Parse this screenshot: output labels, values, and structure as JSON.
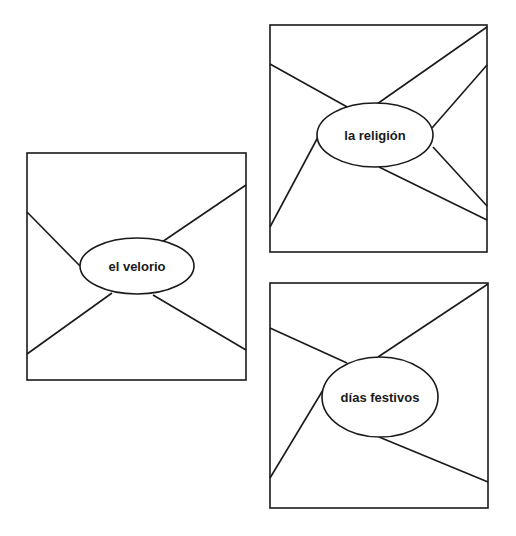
{
  "diagrams": [
    {
      "name": "web-el-velorio",
      "label": "el velorio",
      "box": {
        "x": 27,
        "y": 153,
        "w": 219,
        "h": 227
      },
      "ellipse": {
        "cx": 137,
        "cy": 266,
        "rx": 57,
        "ry": 28
      },
      "spokes": [
        [
          27,
          212,
          80,
          266
        ],
        [
          162,
          242,
          246,
          185
        ],
        [
          112,
          293,
          27,
          354
        ],
        [
          153,
          295,
          246,
          350
        ]
      ]
    },
    {
      "name": "web-la-religion",
      "label": "la religión",
      "box": {
        "x": 270,
        "y": 25,
        "w": 217,
        "h": 227
      },
      "ellipse": {
        "cx": 375,
        "cy": 135,
        "rx": 58,
        "ry": 32
      },
      "spokes": [
        [
          270,
          64,
          349,
          108
        ],
        [
          377,
          104,
          487,
          27
        ],
        [
          432,
          128,
          487,
          65
        ],
        [
          318,
          137,
          270,
          227
        ],
        [
          433,
          147,
          487,
          206
        ],
        [
          379,
          167,
          487,
          220
        ]
      ]
    },
    {
      "name": "web-dias-festivos",
      "label": "días festivos",
      "box": {
        "x": 270,
        "y": 283,
        "w": 218,
        "h": 225
      },
      "ellipse": {
        "cx": 380,
        "cy": 397,
        "rx": 58,
        "ry": 40
      },
      "spokes": [
        [
          270,
          328,
          347,
          363
        ],
        [
          378,
          357,
          488,
          284
        ],
        [
          323,
          390,
          270,
          478
        ],
        [
          379,
          437,
          488,
          482
        ]
      ]
    }
  ]
}
